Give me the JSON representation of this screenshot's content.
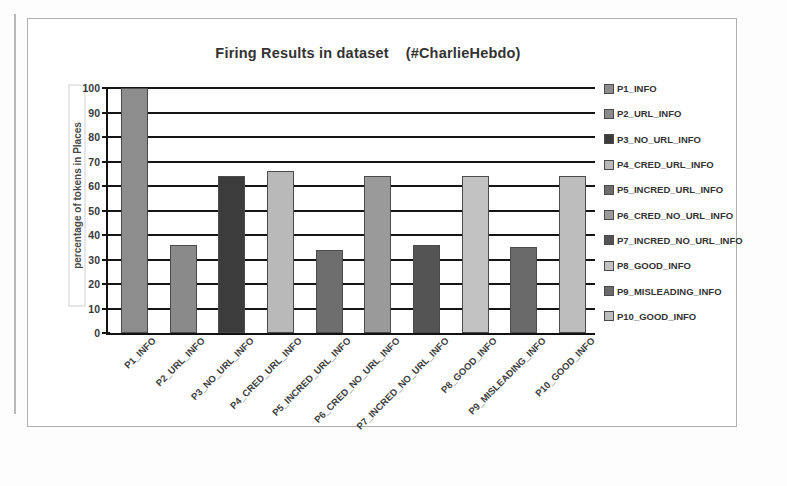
{
  "chart_data": {
    "type": "bar",
    "title": "Firing Results in dataset    (#CharlieHebdo)",
    "xlabel": "",
    "ylabel": "percentage of tokens in Places",
    "ylim": [
      0,
      100
    ],
    "yticks": [
      100,
      90,
      80,
      70,
      60,
      50,
      40,
      30,
      20,
      10,
      0
    ],
    "grid": true,
    "legend_position": "right",
    "categories": [
      "P1_INFO",
      "P2_URL_INFO",
      "P3_NO_URL_INFO",
      "P4_CRED_URL_INFO",
      "P5_INCRED_URL_INFO",
      "P6_CRED_NO_URL_INFO",
      "P7_INCRED_NO_URL_INFO",
      "P8_GOOD_INFO",
      "P9_MISLEADING_INFO",
      "P10_GOOD_INFO"
    ],
    "values": [
      100,
      36,
      64,
      66,
      34,
      64,
      36,
      64,
      35,
      64
    ],
    "colors": [
      "#8d8d8d",
      "#8a8a8a",
      "#3c3c3c",
      "#b9b9b9",
      "#6e6e6e",
      "#9a9a9a",
      "#545454",
      "#c2c2c2",
      "#6a6a6a",
      "#bdbdbd"
    ],
    "legend": [
      "P1_INFO",
      "P2_URL_INFO",
      "P3_NO_URL_INFO",
      "P4_CRED_URL_INFO",
      "P5_INCRED_URL_INFO",
      "P6_CRED_NO_URL_INFO",
      "P7_INCRED_NO_URL_INFO",
      "P8_GOOD_INFO",
      "P9_MISLEADING_INFO",
      "P10_GOOD_INFO"
    ]
  }
}
